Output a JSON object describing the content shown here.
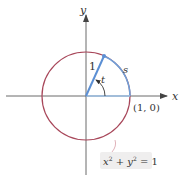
{
  "diagram": {
    "type": "unit-circle",
    "axes": {
      "x_label": "x",
      "y_label": "y"
    },
    "circle": {
      "equation": "x² + y² = 1",
      "eq_lhs_x": "x",
      "eq_sup1": "2",
      "eq_plus": " + ",
      "eq_lhs_y": "y",
      "eq_sup2": "2",
      "eq_rhs": " = 1",
      "radius": 1,
      "color": "#a8475a"
    },
    "radius_label": "1",
    "angle_label": "t",
    "arc_label": "s",
    "point_label": "(1, 0)",
    "colors": {
      "axis": "#6a6a6a",
      "circle": "#a8475a",
      "arc": "#6f9fd8",
      "radius": "#5b8fd4",
      "eq_box": "#efeeee"
    }
  }
}
